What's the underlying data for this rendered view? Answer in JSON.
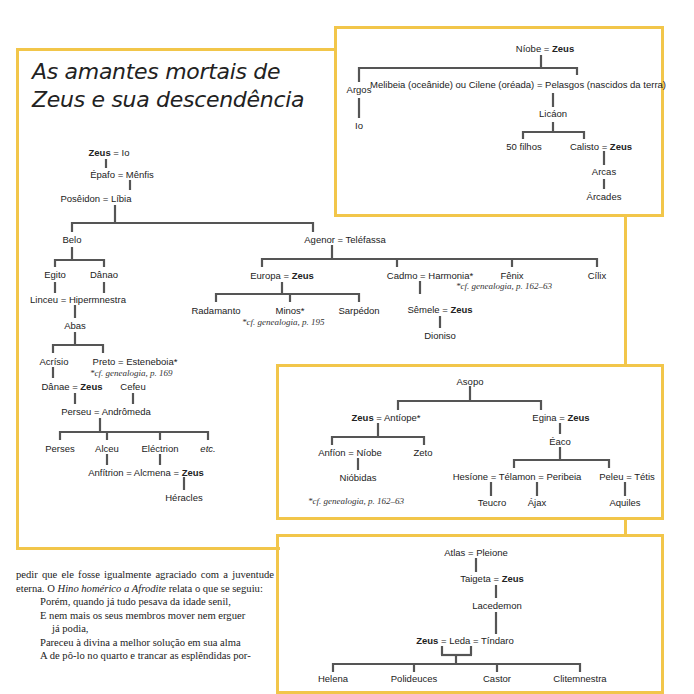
{
  "page": {
    "title_line1": "As amantes mortais de",
    "title_line2": "Zeus e sua descendência",
    "accent_color": "#f2c64a",
    "line_color": "#555555"
  },
  "main_tree": {
    "zeus_io": {
      "a": "Zeus",
      "b": " = Io"
    },
    "epafo": "Épafo = Mênfis",
    "poseidon": "Posêidon = Líbia",
    "belo": "Belo",
    "agenor": "Agenor = Teléfassa",
    "egito": "Egito",
    "danao": "Dânao",
    "linceu": "Linceu = Hipermnestra",
    "abas": "Abas",
    "acrisio": "Acrísio",
    "preto": "Preto = Esteneboia*",
    "preto_note": "*cf. genealogia, p. 169",
    "danae": {
      "a": "Dânae = ",
      "b": "Zeus"
    },
    "cefeu": "Cefeu",
    "perseu": "Perseu = Andrômeda",
    "perses": "Perses",
    "alceu": "Alceu",
    "electrion": "Eléctrion",
    "etc": "etc.",
    "anfitrion": {
      "a": "Anfítrion = Alcmena = ",
      "b": "Zeus"
    },
    "heracles": "Héracles",
    "europa": {
      "a": "Europa = ",
      "b": "Zeus"
    },
    "cadmo": "Cadmo = Harmonia*",
    "fenix": "Fênix",
    "fenix_note": "*cf. genealogia, p. 162–63",
    "cilix": "Cílix",
    "radamanto": "Radamanto",
    "minos": "Minos*",
    "minos_note": "*cf. genealogia, p. 195",
    "sarpedon": "Sarpédon",
    "semele": {
      "a": "Sêmele = ",
      "b": "Zeus"
    },
    "dioniso": "Dioniso"
  },
  "box_niobe": {
    "niobe": {
      "a": "Níobe = ",
      "b": "Zeus"
    },
    "argos": "Argos",
    "melibeia": "Melibeia (oceânide) ou Cilene (oréada) = Pelasgos (nascidos da terra)",
    "io": "Io",
    "licaon": "Licáon",
    "filhos": "50 filhos",
    "calisto": {
      "a": "Calisto = ",
      "b": "Zeus"
    },
    "arcas": "Arcas",
    "arcades": "Árcades"
  },
  "box_asopo": {
    "asopo": "Asopo",
    "zeus_antiope": {
      "a": "Zeus",
      "b": " = Antíope*"
    },
    "egina": {
      "a": "Egina = ",
      "b": "Zeus"
    },
    "anfion": "Anfíon = Níobe",
    "zeto": "Zeto",
    "eaco": "Éaco",
    "niobidas": "Nióbidas",
    "hesione": "Hesíone = Télamon = Peribeia",
    "peleu": "Peleu = Tétis",
    "note": "*cf. genealogia, p. 162–63",
    "teucro": "Teucro",
    "ajax": "Ájax",
    "aquiles": "Aquiles"
  },
  "box_atlas": {
    "atlas": "Atlas = Pleione",
    "taigeta": {
      "a": "Taigeta = ",
      "b": "Zeus"
    },
    "lacedemon": "Lacedemon",
    "leda": {
      "a": "Zeus",
      "b": " = Leda = Tíndaro"
    },
    "helena": "Helena",
    "polideuces": "Polideuces",
    "castor": "Castor",
    "clitemnestra": "Clitemnestra"
  },
  "prose": {
    "p1_a": "pedir que ele fosse igualmente agraciado com a juventude eterna. O ",
    "p1_italic": "Hino homérico a Afrodite",
    "p1_b": " relata o que se seguiu:",
    "verse1": "Porém, quando já tudo pesava da idade senil,",
    "verse2": "E nem mais os seus membros mover nem erguer",
    "verse2_cont": "já podia,",
    "verse3": "Pareceu à divina a melhor solução em sua alma",
    "verse4": "A de pô-lo no quarto e trancar as esplêndidas por-"
  }
}
